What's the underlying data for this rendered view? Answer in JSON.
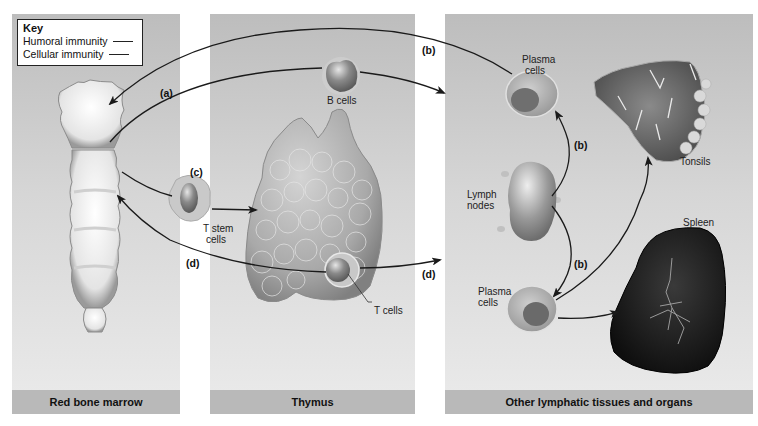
{
  "key": {
    "title": "Key",
    "items": [
      {
        "label": "Humoral immunity",
        "line": "solid"
      },
      {
        "label": "Cellular immunity",
        "line": "solid"
      }
    ]
  },
  "panels": [
    {
      "label": "Red bone marrow"
    },
    {
      "label": "Thymus"
    },
    {
      "label": "Other lymphatic tissues and organs"
    }
  ],
  "cells": {
    "b_cells": "B cells",
    "t_stem_cells_1": "T stem",
    "t_stem_cells_2": "cells",
    "t_cells": "T cells",
    "plasma_top_1": "Plasma",
    "plasma_top_2": "cells",
    "plasma_bottom_1": "Plasma",
    "plasma_bottom_2": "cells",
    "lymph_1": "Lymph",
    "lymph_2": "nodes",
    "tonsils": "Tonsils",
    "spleen": "Spleen"
  },
  "pathways": {
    "a": "(a)",
    "b_top": "(b)",
    "b_mid": "(b)",
    "b_low": "(b)",
    "c": "(c)",
    "d_left": "(d)",
    "d_right": "(d)"
  },
  "colors": {
    "panel_bg_top": "#bdbdbd",
    "panel_bg_bottom": "#ebebeb",
    "label_bar": "#b9b9b9",
    "arrow": "#1a1a1a",
    "spleen": "#1c1c1c"
  }
}
